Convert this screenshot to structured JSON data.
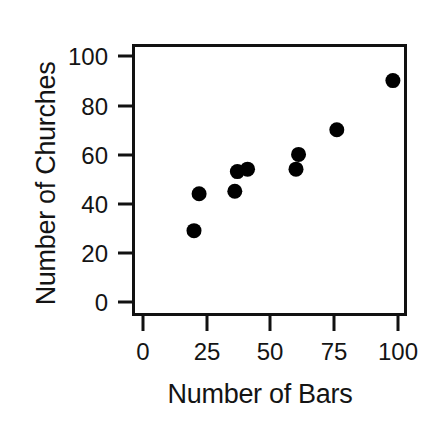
{
  "chart_data": {
    "type": "scatter",
    "title": "",
    "xlabel": "Number of Bars",
    "ylabel": "Number of Churches",
    "xlim": [
      -3,
      103
    ],
    "ylim": [
      -6,
      107
    ],
    "xticks": [
      0,
      25,
      50,
      75,
      100
    ],
    "yticks": [
      0,
      20,
      40,
      60,
      80,
      100
    ],
    "xtick_labels": [
      "0",
      "25",
      "50",
      "75",
      "100"
    ],
    "ytick_labels": [
      "0",
      "20",
      "40",
      "60",
      "80",
      "100"
    ],
    "grid": false,
    "legend": null,
    "marker": {
      "shape": "circle",
      "color": "#000000",
      "size_px": 15
    },
    "series": [
      {
        "name": "cities",
        "points": [
          {
            "x": 20,
            "y": 29
          },
          {
            "x": 22,
            "y": 44
          },
          {
            "x": 36,
            "y": 45
          },
          {
            "x": 37,
            "y": 53
          },
          {
            "x": 41,
            "y": 54
          },
          {
            "x": 60,
            "y": 54
          },
          {
            "x": 61,
            "y": 60
          },
          {
            "x": 76,
            "y": 70
          },
          {
            "x": 98,
            "y": 90
          }
        ]
      }
    ]
  },
  "axes": {
    "y_label_text": "Number of Churches",
    "x_label_text": "Number of Bars",
    "frame_color": "#111111",
    "frame_width_px": 3
  },
  "ytick_labels": {
    "t0": "100",
    "t1": "80",
    "t2": "60",
    "t3": "40",
    "t4": "20",
    "t5": "0"
  },
  "xtick_labels": {
    "t0": "0",
    "t1": "25",
    "t2": "50",
    "t3": "75",
    "t4": "100"
  }
}
